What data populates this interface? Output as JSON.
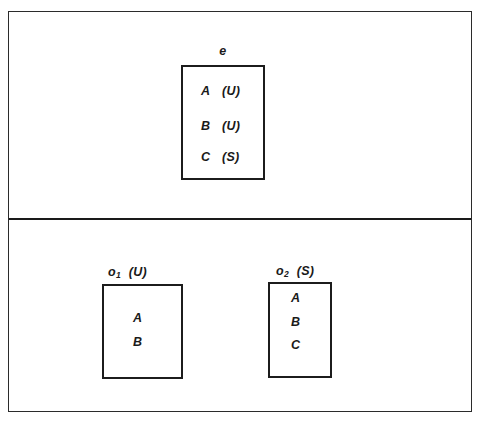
{
  "diagram": {
    "background_color": "#ffffff",
    "line_color": "#1c1c1c",
    "upper_section": {
      "entity_box": {
        "caption_symbol": "e",
        "members": [
          {
            "label": "A",
            "tag": "(U)"
          },
          {
            "label": "B",
            "tag": "(U)"
          },
          {
            "label": "C",
            "tag": "(S)"
          }
        ]
      }
    },
    "lower_section": {
      "observation_boxes": [
        {
          "caption_symbol": "o",
          "caption_subscript": "1",
          "caption_tag": "(U)",
          "members": [
            {
              "label": "A"
            },
            {
              "label": "B"
            }
          ]
        },
        {
          "caption_symbol": "o",
          "caption_subscript": "2",
          "caption_tag": "(S)",
          "members": [
            {
              "label": "A"
            },
            {
              "label": "B"
            },
            {
              "label": "C"
            }
          ]
        }
      ]
    }
  }
}
